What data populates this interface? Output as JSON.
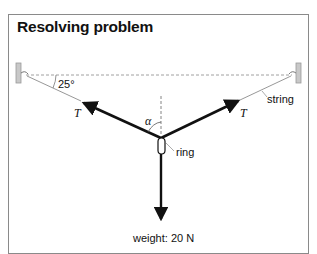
{
  "title": "Resolving problem",
  "labels": {
    "angle": "25°",
    "tension_left": "T",
    "tension_right": "T",
    "alpha": "α",
    "string": "string",
    "ring": "ring",
    "weight": "weight: 20 N"
  },
  "colors": {
    "line": "#111111",
    "string": "#8c8c8c",
    "wall": "#bdbdbd",
    "frame": "#8a8a8a"
  }
}
